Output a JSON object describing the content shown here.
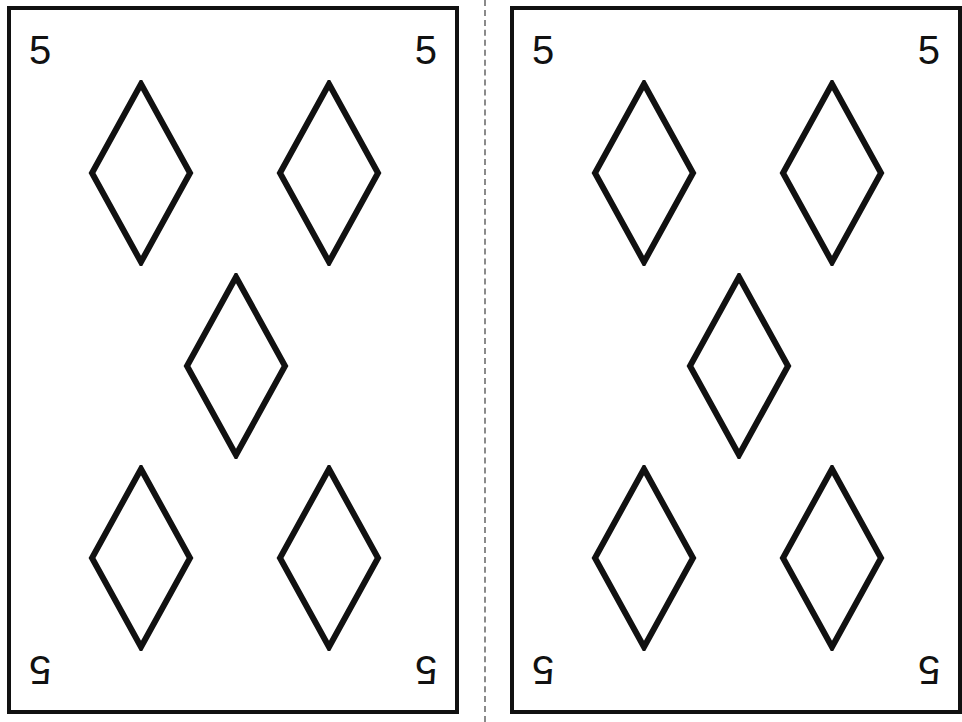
{
  "page": {
    "background_color": "#ffffff",
    "width": 586,
    "height": 722
  },
  "ink": {
    "line_color": "#111111",
    "guide_color": "#8a8a8a",
    "card_face_color": "#ffffff"
  },
  "cut_guide": {
    "label": "cut-line",
    "style": "dashed",
    "orientation": "vertical",
    "color": "#8a8a8a"
  },
  "cards": [
    {
      "id": "card-primary",
      "rank": "5",
      "suit": "diamonds",
      "suit_symbol": "♦",
      "suit_color": "#111111",
      "corners": {
        "top_left": "5",
        "top_right": "5",
        "bottom_left": "5",
        "bottom_right": "5"
      },
      "pip_count": 5,
      "pip_layout": [
        "top-left",
        "top-right",
        "middle-center",
        "bottom-left",
        "bottom-right"
      ],
      "visibility": "full"
    },
    {
      "id": "card-secondary",
      "rank": "5",
      "suit": "diamonds",
      "suit_symbol": "♦",
      "suit_color": "#111111",
      "corners": {
        "top_left": "5",
        "top_right": "5",
        "bottom_left": "5",
        "bottom_right": "5"
      },
      "pip_count": 5,
      "pip_layout": [
        "top-left",
        "top-right",
        "middle-center",
        "bottom-left",
        "bottom-right"
      ],
      "visibility": "clipped-by-page-edge"
    }
  ]
}
